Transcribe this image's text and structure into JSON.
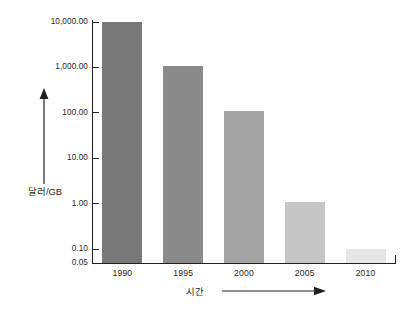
{
  "chart_data": {
    "type": "bar",
    "title": "",
    "xlabel": "시간",
    "ylabel": "달러/GB",
    "categories": [
      "1990",
      "1995",
      "2000",
      "2005",
      "2010"
    ],
    "values": [
      10000,
      1100,
      110,
      1.1,
      0.1
    ],
    "yscale": "log",
    "ylim": [
      0.05,
      10000
    ],
    "ytick_values": [
      10000,
      1000,
      100,
      10,
      1,
      0.1,
      0.05
    ],
    "ytick_labels": [
      "10,000.00",
      "1,000.00",
      "100.00",
      "10.00",
      "1.00",
      "0.10",
      "0.05"
    ],
    "grid": false,
    "legend": false,
    "bar_colors": [
      "#787878",
      "#8a8a8a",
      "#a3a3a3",
      "#c6c6c6",
      "#e6e6e6"
    ],
    "axis_color": "#231f20"
  },
  "axes": {
    "y_title": "달러/GB",
    "x_title": "시간",
    "y_arrow_icon": "up-arrow-icon",
    "x_arrow_icon": "right-arrow-icon"
  },
  "caption": {
    "text": ""
  }
}
